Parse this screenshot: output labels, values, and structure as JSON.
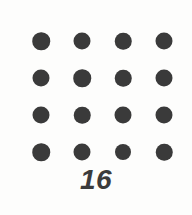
{
  "card": {
    "background_color": "#fdfdfc",
    "width": 192,
    "height": 215
  },
  "dot_grid": {
    "name": "dot-array",
    "rows": 4,
    "columns": 4,
    "total_dots": 16,
    "dot_color": "#3a3a3a",
    "dot_diameter": 17,
    "column_centers_x": [
      41,
      82,
      123,
      164
    ],
    "row_centers_y": [
      41,
      78,
      115,
      152
    ],
    "dots": [
      {
        "row": 1,
        "col": 1,
        "cx": 41,
        "cy": 41,
        "d": 17.5
      },
      {
        "row": 1,
        "col": 2,
        "cx": 82,
        "cy": 41,
        "d": 17.0
      },
      {
        "row": 1,
        "col": 3,
        "cx": 123,
        "cy": 41,
        "d": 16.5
      },
      {
        "row": 1,
        "col": 4,
        "cx": 164,
        "cy": 41,
        "d": 17.0
      },
      {
        "row": 2,
        "col": 1,
        "cx": 41,
        "cy": 78,
        "d": 17.0
      },
      {
        "row": 2,
        "col": 2,
        "cx": 82,
        "cy": 78,
        "d": 17.5
      },
      {
        "row": 2,
        "col": 3,
        "cx": 123,
        "cy": 78,
        "d": 16.5
      },
      {
        "row": 2,
        "col": 4,
        "cx": 164,
        "cy": 78,
        "d": 17.0
      },
      {
        "row": 3,
        "col": 1,
        "cx": 41,
        "cy": 115,
        "d": 17.0
      },
      {
        "row": 3,
        "col": 2,
        "cx": 82,
        "cy": 115,
        "d": 16.5
      },
      {
        "row": 3,
        "col": 3,
        "cx": 123,
        "cy": 115,
        "d": 17.0
      },
      {
        "row": 3,
        "col": 4,
        "cx": 164,
        "cy": 115,
        "d": 17.0
      },
      {
        "row": 4,
        "col": 1,
        "cx": 41,
        "cy": 152,
        "d": 17.5
      },
      {
        "row": 4,
        "col": 2,
        "cx": 82,
        "cy": 152,
        "d": 17.0
      },
      {
        "row": 4,
        "col": 3,
        "cx": 123,
        "cy": 152,
        "d": 16.0
      },
      {
        "row": 4,
        "col": 4,
        "cx": 164,
        "cy": 152,
        "d": 16.5
      }
    ]
  },
  "count_label": {
    "text": "16",
    "color": "#3b3b3b"
  }
}
